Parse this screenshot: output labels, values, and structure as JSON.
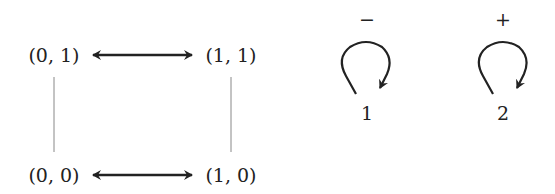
{
  "diagram": {
    "nodes": [
      {
        "id": "n01",
        "label": "(0, 1)"
      },
      {
        "id": "n11",
        "label": "(1, 1)"
      },
      {
        "id": "n00",
        "label": "(0, 0)"
      },
      {
        "id": "n10",
        "label": "(1, 0)"
      }
    ],
    "edges": [
      {
        "from": "(0, 1)",
        "to": "(1, 1)",
        "type": "bidirectional-arrow"
      },
      {
        "from": "(0, 0)",
        "to": "(1, 0)",
        "type": "bidirectional-arrow"
      },
      {
        "from": "(0, 1)",
        "to": "(0, 0)",
        "type": "line"
      },
      {
        "from": "(1, 1)",
        "to": "(1, 0)",
        "type": "line"
      }
    ],
    "loops": [
      {
        "node_label": "1",
        "sign": "−"
      },
      {
        "node_label": "2",
        "sign": "+"
      }
    ]
  }
}
